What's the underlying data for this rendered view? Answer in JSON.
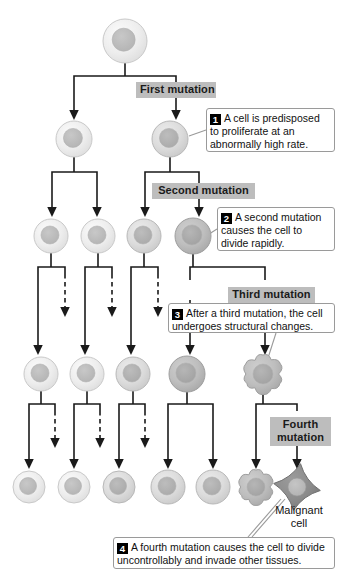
{
  "figure": {
    "type": "flow-diagram"
  },
  "stage_labels": [
    {
      "id": "first",
      "text": "First mutation",
      "x": 136,
      "y": 82,
      "w": 72
    },
    {
      "id": "second",
      "text": "Second mutation",
      "x": 152,
      "y": 183,
      "w": 95
    },
    {
      "id": "third",
      "text": "Third mutation",
      "x": 228,
      "y": 287,
      "w": 79
    },
    {
      "id": "fourth",
      "text": "Fourth mutation",
      "x": 270,
      "y": 417,
      "w": 53
    }
  ],
  "callouts": [
    {
      "id": "callout-1",
      "number": "1",
      "text": "A cell is predisposed to proliferate at an abnormally high rate.",
      "x": 206,
      "y": 108,
      "w": 129,
      "h": 44
    },
    {
      "id": "callout-2",
      "number": "2",
      "text": "A second mutation causes the cell to divide rapidly.",
      "x": 217,
      "y": 207,
      "w": 118,
      "h": 44
    },
    {
      "id": "callout-3",
      "number": "3",
      "text": "After a third mutation, the cell undergoes structural changes.",
      "x": 168,
      "y": 303,
      "w": 167,
      "h": 30
    },
    {
      "id": "callout-4",
      "number": "4",
      "text": "A fourth mutation causes the cell to divide uncontrollably and invade other tissues.",
      "x": 113,
      "y": 537,
      "w": 222,
      "h": 32
    }
  ],
  "captions": [
    {
      "id": "malignant-cell",
      "line1": "Malignant",
      "line2": "cell",
      "x": 262,
      "y": 504
    }
  ],
  "colors": {
    "cell_membrane_light": "#ececec",
    "cell_membrane_mid": "#d8d8d8",
    "cell_membrane_dark": "#b4b4b4",
    "cell_membrane_malignant": "#8c8c8c",
    "nucleus_light": "#bdbdbd",
    "nucleus_mid": "#b0b0b0",
    "nucleus_dark": "#a6a6a6",
    "outline": "#9a9a9a",
    "arrow": "#1a1a1a",
    "chip_bg": "#bdbdbd",
    "callout_border": "#9a9a9a",
    "badge_bg": "#000000"
  },
  "cells": {
    "row0": [
      {
        "id": "cell-root",
        "cx": 125,
        "cy": 41,
        "r": 22,
        "nr": 11.5,
        "shape": "round",
        "tone": "light"
      }
    ],
    "row1": [
      {
        "id": "cell-r1-c1",
        "cx": 74,
        "cy": 139,
        "r": 18,
        "nr": 9.5,
        "shape": "round",
        "tone": "light"
      },
      {
        "id": "cell-r1-c2",
        "cx": 170,
        "cy": 139,
        "r": 18,
        "nr": 9.5,
        "shape": "round",
        "tone": "mid"
      }
    ],
    "row2": [
      {
        "id": "cell-r2-c1",
        "cx": 51,
        "cy": 236,
        "r": 17,
        "nr": 9,
        "shape": "round",
        "tone": "light"
      },
      {
        "id": "cell-r2-c2",
        "cx": 98,
        "cy": 236,
        "r": 17,
        "nr": 9,
        "shape": "round",
        "tone": "light"
      },
      {
        "id": "cell-r2-c3",
        "cx": 144,
        "cy": 236,
        "r": 17,
        "nr": 9,
        "shape": "round",
        "tone": "mid"
      },
      {
        "id": "cell-r2-c4",
        "cx": 193,
        "cy": 236,
        "r": 18,
        "nr": 10,
        "shape": "round",
        "tone": "dark"
      }
    ],
    "row3": [
      {
        "id": "cell-r3-c1",
        "cx": 41,
        "cy": 374,
        "r": 17,
        "nr": 9,
        "shape": "round",
        "tone": "light"
      },
      {
        "id": "cell-r3-c2",
        "cx": 87,
        "cy": 374,
        "r": 17,
        "nr": 9,
        "shape": "round",
        "tone": "light"
      },
      {
        "id": "cell-r3-c3",
        "cx": 133,
        "cy": 374,
        "r": 17,
        "nr": 9,
        "shape": "round",
        "tone": "mid"
      },
      {
        "id": "cell-r3-c4",
        "cx": 187,
        "cy": 374,
        "r": 18,
        "nr": 10,
        "shape": "round",
        "tone": "dark"
      },
      {
        "id": "cell-r3-blob",
        "cx": 263,
        "cy": 374,
        "r": 19,
        "nr": 10,
        "shape": "blob",
        "tone": "dark"
      }
    ],
    "row4": [
      {
        "id": "cell-r4-c1",
        "cx": 29,
        "cy": 487,
        "r": 16,
        "nr": 8.5,
        "shape": "round",
        "tone": "light"
      },
      {
        "id": "cell-r4-c2",
        "cx": 74,
        "cy": 487,
        "r": 16,
        "nr": 8.5,
        "shape": "round",
        "tone": "light"
      },
      {
        "id": "cell-r4-c3",
        "cx": 119,
        "cy": 487,
        "r": 16,
        "nr": 8.5,
        "shape": "round",
        "tone": "mid"
      },
      {
        "id": "cell-r4-c4",
        "cx": 168,
        "cy": 487,
        "r": 17,
        "nr": 9,
        "shape": "round",
        "tone": "mid"
      },
      {
        "id": "cell-r4-c5",
        "cx": 213,
        "cy": 487,
        "r": 17,
        "nr": 9,
        "shape": "round",
        "tone": "mid"
      },
      {
        "id": "cell-r4-blob",
        "cx": 256,
        "cy": 487,
        "r": 17,
        "nr": 9,
        "shape": "blob",
        "tone": "dark"
      },
      {
        "id": "cell-r4-malignant",
        "cx": 297,
        "cy": 487,
        "r": 21,
        "nr": 9,
        "shape": "star",
        "tone": "malignant"
      }
    ]
  }
}
